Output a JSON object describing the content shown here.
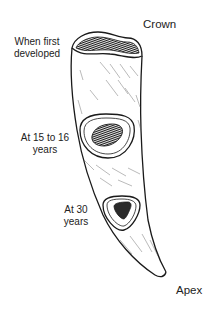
{
  "diagram": {
    "labels": {
      "crown": "Crown",
      "first_line1": "When first",
      "first_line2": "developed",
      "mid_line1": "At 15 to 16",
      "mid_line2": "years",
      "late_line1": "At 30",
      "late_line2": "years",
      "apex": "Apex"
    },
    "colors": {
      "stroke": "#1a1a1a",
      "background": "#ffffff",
      "pulp_fill": "#2a2a2a"
    }
  }
}
